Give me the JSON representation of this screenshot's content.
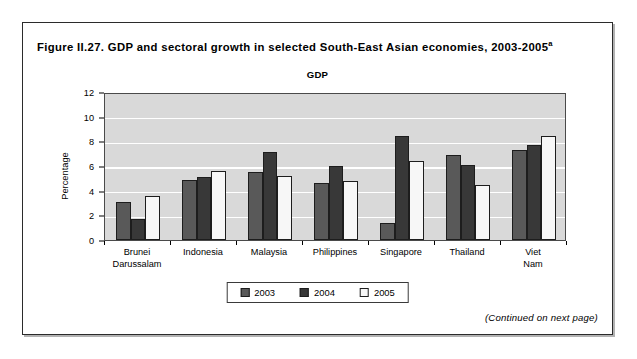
{
  "figure": {
    "title_main": "Figure II.27. GDP and sectoral growth in selected South-East Asian economies, 2003-2005",
    "title_superscript": "a",
    "continued_note": "(Continued on next page)"
  },
  "chart_data": {
    "type": "bar",
    "title": "GDP",
    "xlabel": "",
    "ylabel": "Percentage",
    "ylim": [
      0,
      12
    ],
    "yticks": [
      0,
      2,
      4,
      6,
      8,
      10,
      12
    ],
    "ytick_labels": [
      "0",
      "2",
      "4",
      "6",
      "8",
      "10",
      "12"
    ],
    "grid": true,
    "legend_position": "bottom-center",
    "categories": [
      "Brunei\nDarussalam",
      "Indonesia",
      "Malaysia",
      "Philippines",
      "Singapore",
      "Thailand",
      "Viet Nam"
    ],
    "series": [
      {
        "name": "2003",
        "color": "#595959",
        "values": [
          3.1,
          4.9,
          5.5,
          4.6,
          1.4,
          6.9,
          7.3
        ]
      },
      {
        "name": "2004",
        "color": "#383838",
        "values": [
          1.7,
          5.1,
          7.1,
          6.0,
          8.4,
          6.1,
          7.7
        ]
      },
      {
        "name": "2005",
        "color": "#f7f7f7",
        "values": [
          3.6,
          5.6,
          5.2,
          4.8,
          6.4,
          4.5,
          8.4
        ]
      }
    ]
  },
  "colors": {
    "plot_background": "#d9d9d9",
    "gridline": "#ffffff",
    "frame_border": "#2b2b2b",
    "axis": "#000000"
  }
}
